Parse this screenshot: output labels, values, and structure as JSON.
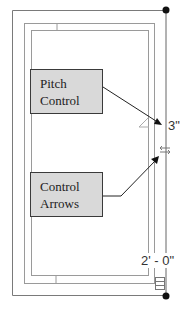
{
  "diagram": {
    "callouts": [
      {
        "id": "pitch-control",
        "label_line1": "Pitch",
        "label_line2": "Control"
      },
      {
        "id": "control-arrows",
        "label_line1": "Control",
        "label_line2": "Arrows"
      }
    ],
    "dimensions": {
      "height_label": "3\"",
      "width_label": "2' - 0\""
    },
    "colors": {
      "callout_fill": "#d9d9d9",
      "line": "#8a8a8a",
      "dark": "#111111"
    }
  }
}
